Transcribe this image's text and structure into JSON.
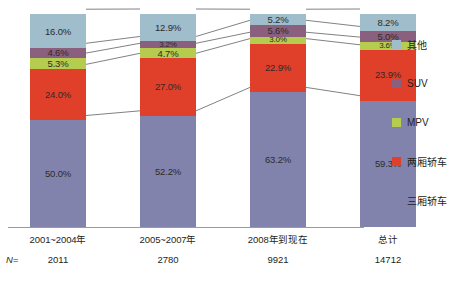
{
  "chart_data": {
    "type": "bar",
    "subtype": "stacked-100-percent",
    "title": "",
    "xlabel": "",
    "ylabel": "",
    "ylim": [
      0,
      100
    ],
    "grid": false,
    "legend_position": "right",
    "categories": [
      "2001~2004年",
      "2005~2007年",
      "2008年到现在",
      "总计"
    ],
    "sample_sizes": [
      "2011",
      "2780",
      "9921",
      "14712"
    ],
    "sample_size_label": "N=",
    "series": [
      {
        "name": "三厢轿车",
        "color": "#8183ac",
        "values": [
          50.0,
          52.2,
          63.2,
          59.3
        ],
        "labels": [
          "50.0%",
          "52.2%",
          "63.2%",
          "59.3%"
        ]
      },
      {
        "name": "两厢轿车",
        "color": "#e0402a",
        "values": [
          24.0,
          27.0,
          22.9,
          23.9
        ],
        "labels": [
          "24.0%",
          "27.0%",
          "22.9%",
          "23.9%"
        ]
      },
      {
        "name": "MPV",
        "color": "#b5cc4f",
        "values": [
          5.3,
          4.7,
          3.0,
          3.6
        ],
        "labels": [
          "5.3%",
          "4.7%",
          "3.0%",
          "3.6%"
        ]
      },
      {
        "name": "SUV",
        "color": "#8b5f7e",
        "values": [
          4.6,
          3.2,
          5.6,
          5.0
        ],
        "labels": [
          "4.6%",
          "3.2%",
          "5.6%",
          "5.0%"
        ]
      },
      {
        "name": "其他",
        "color": "#9fbdcb",
        "values": [
          16.0,
          12.9,
          5.2,
          8.2
        ],
        "labels": [
          "16.0%",
          "12.9%",
          "5.2%",
          "8.2%"
        ]
      }
    ],
    "legend_entries": [
      "其他",
      "SUV",
      "MPV",
      "两厢轿车",
      "三厢轿车"
    ],
    "connector_lines": true,
    "axis_color": "#9a9a9a"
  }
}
